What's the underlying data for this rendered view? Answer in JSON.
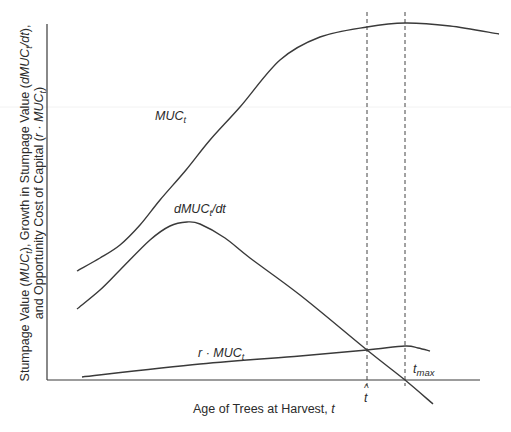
{
  "chart_data": {
    "type": "line",
    "title": "",
    "xlabel": "Age of Trees at Harvest, t",
    "xlabel_parts": {
      "text": "Age of Trees at Harvest, ",
      "var": "t"
    },
    "ylabel_line1": {
      "a": "Stumpage Value (",
      "b": "MUC",
      "bsub": "t",
      "c": "), Growth in Stumpage Value (",
      "d": "dMUC",
      "dsub": "t",
      "e": "/dt",
      "f": "),"
    },
    "ylabel_line2": {
      "a": "and Opportunity Cost of Capital (",
      "b": "r · MUC",
      "bsub": "t",
      "c": ")"
    },
    "grid": false,
    "ticks": false,
    "series": [
      {
        "name": "MUC_t",
        "label_main": "MUC",
        "label_sub": "t",
        "shape": "sigmoid rising to maximum at t_max then declining",
        "points_px": [
          [
            77,
            271
          ],
          [
            100,
            258
          ],
          [
            120,
            245
          ],
          [
            140,
            225
          ],
          [
            160,
            200
          ],
          [
            186,
            170
          ],
          [
            210,
            140
          ],
          [
            240,
            107
          ],
          [
            280,
            60
          ],
          [
            320,
            37
          ],
          [
            367,
            27
          ],
          [
            405,
            23
          ],
          [
            450,
            26
          ],
          [
            499,
            34
          ]
        ]
      },
      {
        "name": "dMUC_t/dt",
        "label_main": "dMUC",
        "label_sub": "t",
        "label_tail": "/dt",
        "shape": "hump peaking early then declining linearly, crossing zero at t_max",
        "points_px": [
          [
            77,
            309
          ],
          [
            100,
            290
          ],
          [
            120,
            270
          ],
          [
            150,
            240
          ],
          [
            170,
            226
          ],
          [
            187,
            222
          ],
          [
            200,
            224
          ],
          [
            225,
            238
          ],
          [
            250,
            258
          ],
          [
            300,
            295
          ],
          [
            367,
            350
          ],
          [
            405,
            380
          ],
          [
            433,
            404
          ]
        ]
      },
      {
        "name": "r · MUC_t",
        "label_main": "r · MUC",
        "label_sub": "t",
        "shape": "shallow rising line proportional to MUC",
        "points_px": [
          [
            82,
            377
          ],
          [
            200,
            364
          ],
          [
            300,
            356
          ],
          [
            367,
            350
          ],
          [
            405,
            346
          ],
          [
            418,
            348
          ],
          [
            430,
            351
          ]
        ]
      }
    ],
    "annotations": [
      {
        "id": "t_hat",
        "main": "t",
        "accent": "^",
        "x_px": 367,
        "meaning": "optimal harvest age where dMUC/dt = r·MUC"
      },
      {
        "id": "t_max",
        "main": "t",
        "sub": "max",
        "x_px": 405,
        "meaning": "age of maximum stumpage value where dMUC/dt = 0"
      }
    ],
    "reference_lines": [
      {
        "type": "vertical-dashed",
        "at": "t_hat",
        "x_px": 367
      },
      {
        "type": "vertical-dashed",
        "at": "t_max",
        "x_px": 405
      }
    ]
  },
  "colors": {
    "line": "#3a3a3a",
    "text": "#2b2b2b",
    "background": "#ffffff"
  }
}
